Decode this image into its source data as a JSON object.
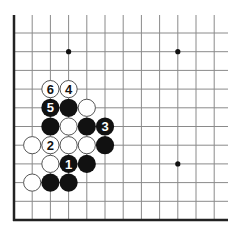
{
  "diagram": {
    "type": "go-board-fragment",
    "visible_columns": 12,
    "visible_rows": 11,
    "edges": [
      "left",
      "bottom"
    ],
    "colors": {
      "background": "#ffffff",
      "grid_line": "#8a8a8a",
      "edge_line": "#222222",
      "black_stone": "#111111",
      "white_stone": "#ffffff",
      "white_stone_border": "#555555",
      "star_point": "#111111"
    },
    "star_points": [
      {
        "col": 3,
        "row": 9
      },
      {
        "col": 9,
        "row": 9
      },
      {
        "col": 9,
        "row": 3
      }
    ],
    "stones": [
      {
        "color": "white",
        "col": 2,
        "row": 7,
        "label": "6"
      },
      {
        "color": "white",
        "col": 3,
        "row": 7,
        "label": "4"
      },
      {
        "color": "black",
        "col": 2,
        "row": 6,
        "label": "5"
      },
      {
        "color": "black",
        "col": 3,
        "row": 6,
        "label": ""
      },
      {
        "color": "white",
        "col": 4,
        "row": 6,
        "label": ""
      },
      {
        "color": "black",
        "col": 2,
        "row": 5,
        "label": ""
      },
      {
        "color": "white",
        "col": 3,
        "row": 5,
        "label": ""
      },
      {
        "color": "black",
        "col": 4,
        "row": 5,
        "label": ""
      },
      {
        "color": "black",
        "col": 5,
        "row": 5,
        "label": "3"
      },
      {
        "color": "white",
        "col": 1,
        "row": 4,
        "label": ""
      },
      {
        "color": "white",
        "col": 2,
        "row": 4,
        "label": "2"
      },
      {
        "color": "white",
        "col": 3,
        "row": 4,
        "label": ""
      },
      {
        "color": "white",
        "col": 4,
        "row": 4,
        "label": ""
      },
      {
        "color": "black",
        "col": 5,
        "row": 4,
        "label": ""
      },
      {
        "color": "white",
        "col": 2,
        "row": 3,
        "label": ""
      },
      {
        "color": "black",
        "col": 3,
        "row": 3,
        "label": "1"
      },
      {
        "color": "black",
        "col": 4,
        "row": 3,
        "label": ""
      },
      {
        "color": "white",
        "col": 1,
        "row": 2,
        "label": ""
      },
      {
        "color": "black",
        "col": 2,
        "row": 2,
        "label": ""
      },
      {
        "color": "black",
        "col": 3,
        "row": 2,
        "label": ""
      }
    ]
  }
}
